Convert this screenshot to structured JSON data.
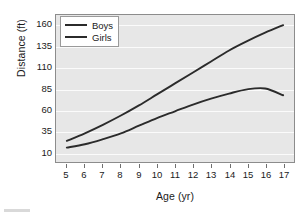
{
  "chart_data": {
    "type": "line",
    "title": "",
    "xlabel": "Age (yr)",
    "ylabel": "Distance (ft)",
    "xlim": [
      4.4,
      17.6
    ],
    "ylim": [
      -2,
      172
    ],
    "xticks": [
      5,
      6,
      7,
      8,
      9,
      10,
      11,
      12,
      13,
      14,
      15,
      16,
      17
    ],
    "yticks": [
      10,
      35,
      60,
      85,
      110,
      135,
      160
    ],
    "grid": "horizontal",
    "legend_position": "upper-left-inside",
    "x": [
      5,
      6,
      7,
      8,
      9,
      10,
      11,
      12,
      13,
      14,
      15,
      16,
      17
    ],
    "series": [
      {
        "name": "Boys",
        "color": "#2b2b2b",
        "values": [
          23,
          32,
          42,
          53,
          65,
          78,
          91,
          104,
          117,
          130,
          141,
          151,
          160
        ]
      },
      {
        "name": "Girls",
        "color": "#2b2b2b",
        "values": [
          15,
          19,
          25,
          32,
          41,
          50,
          58,
          66,
          73,
          79,
          84,
          85,
          77
        ]
      }
    ]
  },
  "legend": {
    "items": [
      {
        "label": "Boys"
      },
      {
        "label": "Girls"
      }
    ]
  },
  "axes": {
    "y_title": "Distance (ft)",
    "x_title": "Age (yr)"
  }
}
